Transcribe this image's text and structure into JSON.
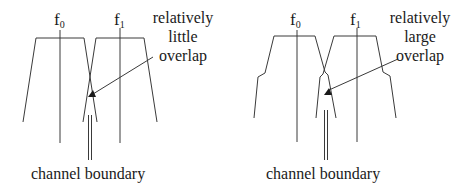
{
  "panels": [
    {
      "id": "left",
      "channel_labels": [
        {
          "base": "f",
          "sub": "0"
        },
        {
          "base": "f",
          "sub": "1"
        }
      ],
      "annotation": [
        "relatively",
        "little",
        "overlap"
      ],
      "caption": "channel boundary"
    },
    {
      "id": "right",
      "channel_labels": [
        {
          "base": "f",
          "sub": "0"
        },
        {
          "base": "f",
          "sub": "1"
        }
      ],
      "annotation": [
        "relatively",
        "large",
        "overlap"
      ],
      "caption": "channel boundary"
    }
  ],
  "colors": {
    "line": "#3a3a3a",
    "text": "#1a1a1a",
    "background": "#ffffff"
  }
}
